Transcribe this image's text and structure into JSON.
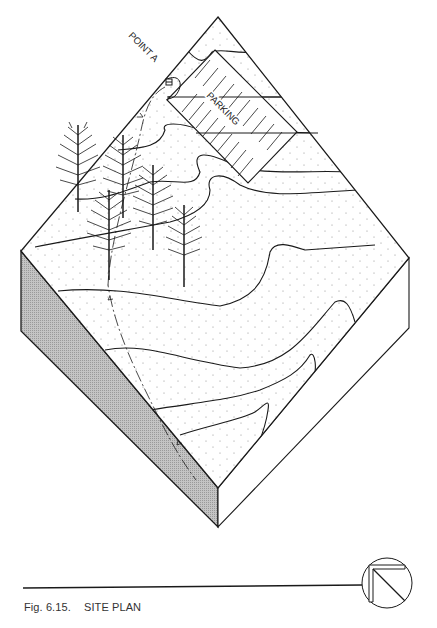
{
  "figure": {
    "number": "Fig. 6.15.",
    "title": "SITE PLAN"
  },
  "labels": {
    "point_a": "POINT A",
    "parking": "PARKING"
  },
  "symbols": {
    "north_arrow": "north-arrow-icon",
    "point_marker": "survey-point-icon"
  },
  "elements": {
    "trees_count": 5,
    "contour_lines_count": 10,
    "path": "dashed path with direction arrows from Point A downhill"
  },
  "colors": {
    "line": "#1a1a1a",
    "side_shade": "#b8b8b8",
    "background": "#ffffff",
    "stipple": "#888888"
  }
}
